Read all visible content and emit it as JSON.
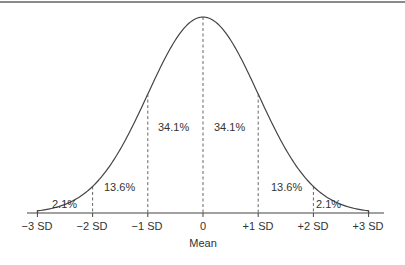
{
  "chart_data": {
    "type": "area",
    "title": "",
    "subtitle": "",
    "xlabel": "Mean",
    "ylabel": "",
    "categories": [
      "-3 SD",
      "-2 SD",
      "-1 SD",
      "0",
      "+1 SD",
      "+2 SD",
      "+3 SD"
    ],
    "x": [
      -3,
      -2,
      -1,
      0,
      1,
      2,
      3
    ],
    "regions": [
      {
        "from": -3,
        "to": -2,
        "label": "2.1%",
        "value": 2.1
      },
      {
        "from": -2,
        "to": -1,
        "label": "13.6%",
        "value": 13.6
      },
      {
        "from": -1,
        "to": 0,
        "label": "34.1%",
        "value": 34.1
      },
      {
        "from": 0,
        "to": 1,
        "label": "34.1%",
        "value": 34.1
      },
      {
        "from": 1,
        "to": 2,
        "label": "13.6%",
        "value": 13.6
      },
      {
        "from": 2,
        "to": 3,
        "label": "2.1%",
        "value": 2.1
      }
    ],
    "curve": "normal distribution (bell curve)",
    "xlim": [
      -3,
      3
    ],
    "grid": false,
    "legend": null,
    "annotations": [
      "dashed vertical lines at each SD mark"
    ]
  },
  "axis": {
    "tick_labels": [
      "−3 SD",
      "−2 SD",
      "−1 SD",
      "0",
      "+1 SD",
      "+2 SD",
      "+3 SD"
    ],
    "xlabel": "Mean"
  },
  "regions": {
    "r1": "2.1%",
    "r2": "13.6%",
    "r3": "34.1%",
    "r4": "34.1%",
    "r5": "13.6%",
    "r6": "2.1%"
  },
  "colors": {
    "line": "#444444",
    "text": "#333333",
    "top_rule": "#8a8a8a"
  }
}
